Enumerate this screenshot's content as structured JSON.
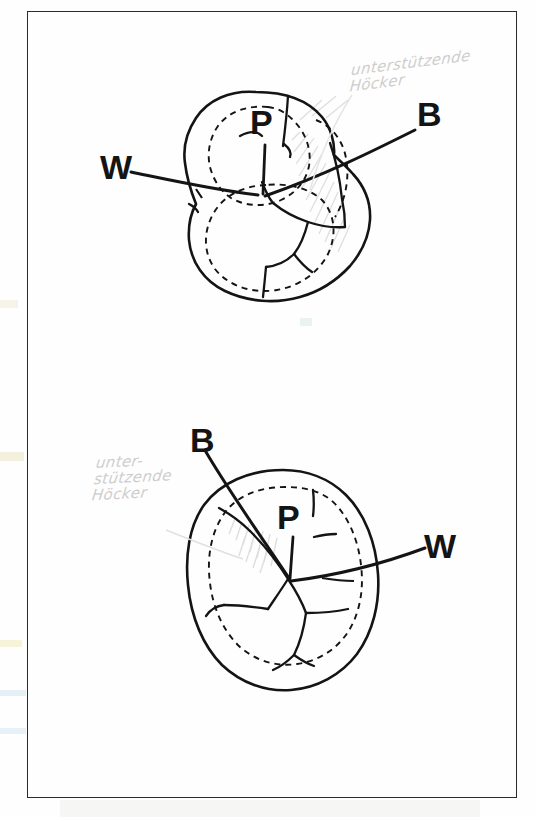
{
  "document": {
    "title": "Hand-drawn dental occlusal diagram",
    "background_color": "#fefefe",
    "frame_color": "#2b2b2b",
    "ink_color": "#141414",
    "pencil_color": "#cdcdcd"
  },
  "figures": [
    {
      "id": "upper-molar",
      "description": "Upper molar occlusal surface, rotated, with dashed inner contour and fissure pattern",
      "labels": [
        {
          "key": "W",
          "text": "W",
          "meaning": "Wange / buccal"
        },
        {
          "key": "P",
          "text": "P",
          "meaning": "Palatinal"
        },
        {
          "key": "B",
          "text": "B",
          "meaning": "Bukkal"
        }
      ],
      "annotation": {
        "line1": "unterstützende",
        "line2": "Höcker"
      }
    },
    {
      "id": "lower-molar",
      "description": "Lower molar occlusal surface, oval, with dashed inner contour and fissure pattern",
      "labels": [
        {
          "key": "B",
          "text": "B",
          "meaning": "Bukkal"
        },
        {
          "key": "P",
          "text": "P",
          "meaning": "Palatinal"
        },
        {
          "key": "W",
          "text": "W",
          "meaning": "Wange / buccal"
        }
      ],
      "annotation": {
        "line1": "unter-",
        "line2": "stützende",
        "line3": "Höcker"
      }
    }
  ]
}
